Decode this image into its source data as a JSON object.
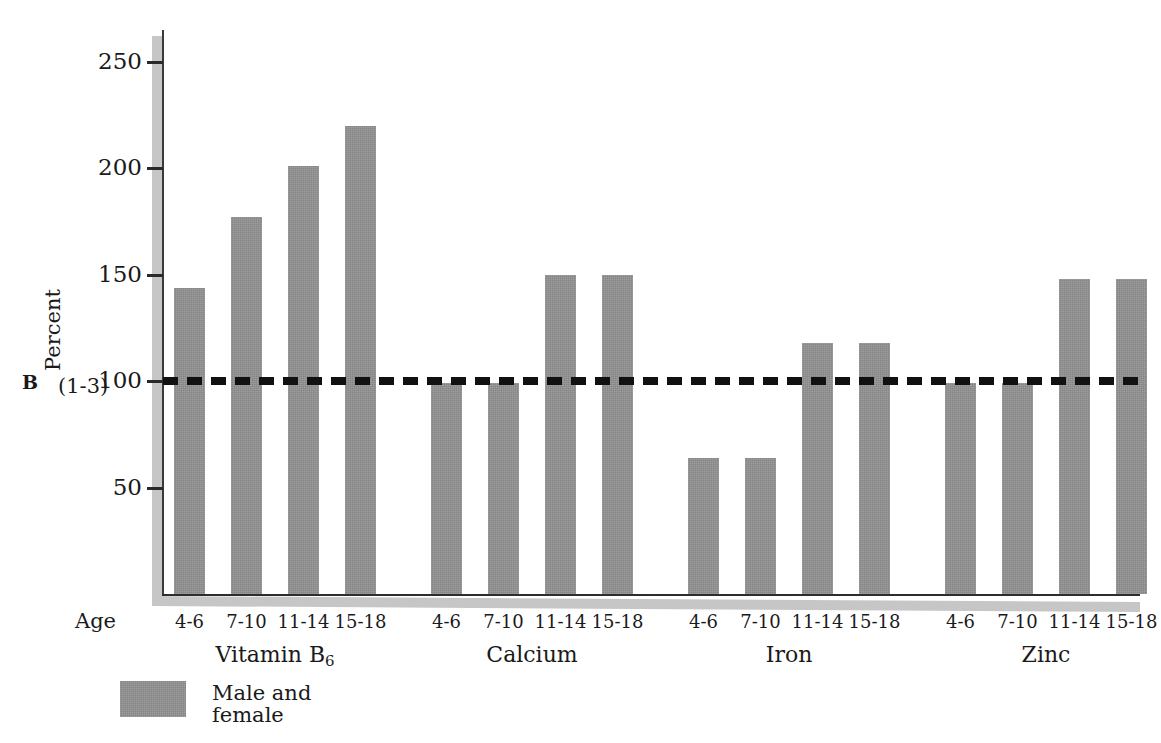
{
  "panel": {
    "letter": "B"
  },
  "axes": {
    "y_title": "Percent",
    "y_ticks": [
      50,
      100,
      150,
      200,
      250
    ],
    "y_tick_labels": [
      "50",
      "100",
      "150",
      "200",
      "250"
    ],
    "y_min": 0,
    "y_max": 265,
    "rda_note": "(1-3)",
    "x_axis_label": "Age"
  },
  "legend": {
    "label": "Male and\nfemale",
    "swatch_color": "#858585"
  },
  "reference_line": {
    "value": 100,
    "style": "dashed",
    "color": "#111111"
  },
  "chart_data": {
    "type": "bar",
    "title": "",
    "xlabel": "Age",
    "ylabel": "Percent",
    "ylim": [
      0,
      265
    ],
    "grid": false,
    "legend_position": "bottom-left",
    "reference_line_y": 100,
    "groups": [
      "Vitamin B6",
      "Calcium",
      "Iron",
      "Zinc"
    ],
    "group_labels_html": [
      "Vitamin B<sub>6</sub>",
      "Calcium",
      "Iron",
      "Zinc"
    ],
    "categories": [
      "4-6",
      "7-10",
      "11-14",
      "15-18"
    ],
    "series": [
      {
        "name": "Male and female",
        "color": "#858585",
        "values": {
          "Vitamin B6": [
            144,
            177,
            201,
            220
          ],
          "Calcium": [
            99,
            99,
            150,
            150
          ],
          "Iron": [
            64,
            64,
            118,
            118
          ],
          "Zinc": [
            99,
            99,
            148,
            148
          ]
        }
      }
    ],
    "bars": [
      {
        "group": "Vitamin B6",
        "age": "4-6",
        "value": 144
      },
      {
        "group": "Vitamin B6",
        "age": "7-10",
        "value": 177
      },
      {
        "group": "Vitamin B6",
        "age": "11-14",
        "value": 201
      },
      {
        "group": "Vitamin B6",
        "age": "15-18",
        "value": 220
      },
      {
        "group": "Calcium",
        "age": "4-6",
        "value": 99
      },
      {
        "group": "Calcium",
        "age": "7-10",
        "value": 99
      },
      {
        "group": "Calcium",
        "age": "11-14",
        "value": 150
      },
      {
        "group": "Calcium",
        "age": "15-18",
        "value": 150
      },
      {
        "group": "Iron",
        "age": "4-6",
        "value": 64
      },
      {
        "group": "Iron",
        "age": "7-10",
        "value": 64
      },
      {
        "group": "Iron",
        "age": "11-14",
        "value": 118
      },
      {
        "group": "Iron",
        "age": "15-18",
        "value": 118
      },
      {
        "group": "Zinc",
        "age": "4-6",
        "value": 99
      },
      {
        "group": "Zinc",
        "age": "7-10",
        "value": 99
      },
      {
        "group": "Zinc",
        "age": "11-14",
        "value": 148
      },
      {
        "group": "Zinc",
        "age": "15-18",
        "value": 148
      }
    ]
  }
}
